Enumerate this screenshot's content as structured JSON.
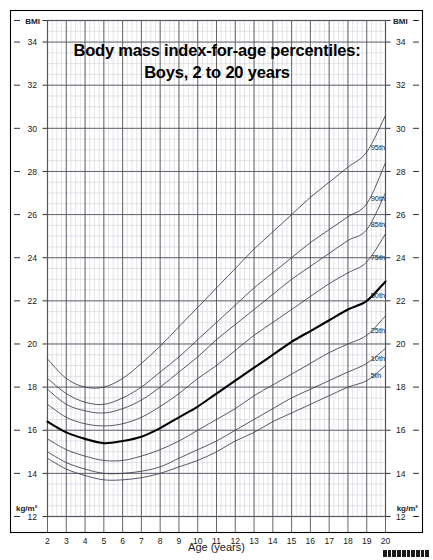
{
  "chart_data": {
    "type": "line",
    "title": "Body mass index-for-age percentiles:",
    "subtitle": "Boys, 2 to 20 years",
    "xlabel": "Age (years)",
    "ylabel": "BMI",
    "yunits": "kg/m²",
    "xlim": [
      2,
      20
    ],
    "ylim": [
      12,
      35
    ],
    "grid": true,
    "legend_position": "right-inline",
    "x_ticks": [
      2,
      3,
      4,
      5,
      6,
      7,
      8,
      9,
      10,
      11,
      12,
      13,
      14,
      15,
      16,
      17,
      18,
      19,
      20
    ],
    "y_ticks": [
      12,
      14,
      16,
      18,
      20,
      22,
      24,
      26,
      28,
      30,
      32,
      34
    ],
    "x_minor_step": 0.25,
    "y_minor_step": 0.5,
    "x": [
      2,
      3,
      4,
      5,
      6,
      7,
      8,
      9,
      10,
      11,
      12,
      13,
      14,
      15,
      16,
      17,
      18,
      19,
      20
    ],
    "series": [
      {
        "name": "95th",
        "label": "95th",
        "emphasis": false,
        "values": [
          19.3,
          18.4,
          18.0,
          18.0,
          18.4,
          19.1,
          19.9,
          20.8,
          21.7,
          22.6,
          23.5,
          24.4,
          25.2,
          26.0,
          26.8,
          27.5,
          28.2,
          28.9,
          30.6
        ]
      },
      {
        "name": "90th",
        "label": "90th",
        "emphasis": false,
        "values": [
          18.4,
          17.7,
          17.3,
          17.2,
          17.5,
          18.0,
          18.7,
          19.4,
          20.2,
          21.0,
          21.8,
          22.6,
          23.3,
          24.0,
          24.7,
          25.3,
          25.9,
          26.5,
          28.4
        ]
      },
      {
        "name": "85th",
        "label": "85th",
        "emphasis": false,
        "values": [
          17.9,
          17.2,
          16.9,
          16.8,
          17.0,
          17.4,
          18.0,
          18.7,
          19.4,
          20.2,
          20.9,
          21.6,
          22.3,
          23.0,
          23.6,
          24.2,
          24.8,
          25.3,
          27.0
        ]
      },
      {
        "name": "75th",
        "label": "75th",
        "emphasis": false,
        "values": [
          17.2,
          16.6,
          16.3,
          16.2,
          16.3,
          16.6,
          17.1,
          17.7,
          18.4,
          19.0,
          19.7,
          20.4,
          21.0,
          21.6,
          22.2,
          22.8,
          23.3,
          23.8,
          25.1
        ]
      },
      {
        "name": "50th",
        "label": "50th",
        "emphasis": true,
        "values": [
          16.4,
          15.9,
          15.6,
          15.4,
          15.5,
          15.7,
          16.1,
          16.6,
          17.1,
          17.7,
          18.3,
          18.9,
          19.5,
          20.1,
          20.6,
          21.1,
          21.6,
          22.0,
          22.9
        ]
      },
      {
        "name": "25th",
        "label": "25th",
        "emphasis": false,
        "values": [
          15.6,
          15.1,
          14.8,
          14.6,
          14.6,
          14.8,
          15.1,
          15.5,
          16.0,
          16.5,
          17.0,
          17.6,
          18.1,
          18.6,
          19.1,
          19.6,
          20.0,
          20.4,
          21.3
        ]
      },
      {
        "name": "10th",
        "label": "10th",
        "emphasis": false,
        "values": [
          15.0,
          14.5,
          14.2,
          14.0,
          14.0,
          14.1,
          14.3,
          14.7,
          15.1,
          15.5,
          16.0,
          16.5,
          17.0,
          17.5,
          17.9,
          18.3,
          18.7,
          19.1,
          19.8
        ]
      },
      {
        "name": "5th",
        "label": "5th",
        "emphasis": false,
        "values": [
          14.7,
          14.2,
          13.9,
          13.7,
          13.7,
          13.8,
          14.0,
          14.3,
          14.6,
          15.0,
          15.5,
          15.9,
          16.4,
          16.8,
          17.2,
          17.6,
          18.0,
          18.3,
          19.0
        ]
      }
    ],
    "colors": {
      "curve": "#3a3a4a",
      "curve_emphasis": "#000000",
      "grid_major": "#555560",
      "grid_minor": "#c8c8d0",
      "border": "#000000",
      "text": "#1a1a1a"
    }
  },
  "corner_labels": {
    "top_left": "BMI",
    "top_right": "BMI",
    "bottom_left": "kg/m²",
    "bottom_right": "kg/m²"
  },
  "footer": {
    "barcode_name": "barcode-mark"
  }
}
